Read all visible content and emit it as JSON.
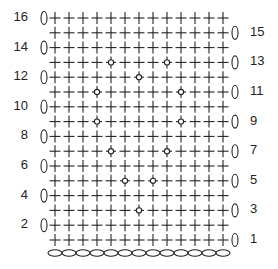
{
  "grid": {
    "columns": 13,
    "rows": 16,
    "col_x0": 55,
    "col_step": 14,
    "row1_y": 240,
    "row_step": 14.8,
    "chain_y": 253
  },
  "legend_symbols": {
    "plus": "single-crochet",
    "diamond": "dot-stitch",
    "zero": "turning-chain",
    "oval": "foundation-chain"
  },
  "foundation_chain_count": 13,
  "rows": [
    {
      "n": 1,
      "label": "1",
      "side": "right",
      "special_cols": []
    },
    {
      "n": 2,
      "label": "2",
      "side": "left",
      "special_cols": []
    },
    {
      "n": 3,
      "label": "3",
      "side": "right",
      "special_cols": [
        7
      ]
    },
    {
      "n": 4,
      "label": "4",
      "side": "left",
      "special_cols": []
    },
    {
      "n": 5,
      "label": "5",
      "side": "right",
      "special_cols": [
        6,
        8
      ]
    },
    {
      "n": 6,
      "label": "6",
      "side": "left",
      "special_cols": []
    },
    {
      "n": 7,
      "label": "7",
      "side": "right",
      "special_cols": [
        5,
        9
      ]
    },
    {
      "n": 8,
      "label": "8",
      "side": "left",
      "special_cols": []
    },
    {
      "n": 9,
      "label": "9",
      "side": "right",
      "special_cols": [
        4,
        10
      ]
    },
    {
      "n": 10,
      "label": "10",
      "side": "left",
      "special_cols": []
    },
    {
      "n": 11,
      "label": "11",
      "side": "right",
      "special_cols": [
        4,
        10
      ]
    },
    {
      "n": 12,
      "label": "12",
      "side": "left",
      "special_cols": [
        7
      ]
    },
    {
      "n": 13,
      "label": "13",
      "side": "right",
      "special_cols": [
        5,
        9
      ]
    },
    {
      "n": 14,
      "label": "14",
      "side": "left",
      "special_cols": []
    },
    {
      "n": 15,
      "label": "15",
      "side": "right",
      "special_cols": []
    },
    {
      "n": 16,
      "label": "16",
      "side": "left",
      "special_cols": []
    }
  ],
  "colors": {
    "ink": "#222222",
    "background": "#ffffff"
  }
}
